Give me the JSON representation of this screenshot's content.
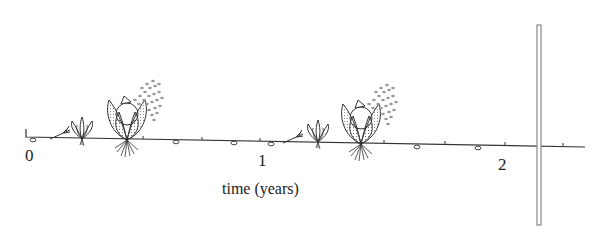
{
  "diagram": {
    "axis": {
      "title": "time (years)",
      "ticks": [
        {
          "label": "0",
          "value": 0
        },
        {
          "label": "1",
          "value": 1
        },
        {
          "label": "2",
          "value": 2
        }
      ]
    },
    "stages_per_cycle": [
      "seed",
      "seedling",
      "young-plant",
      "flowering-plant-releasing-seeds"
    ],
    "cycles": 2,
    "marker": "vertical-bar-after-year-2",
    "colors": {
      "line": "#333333",
      "bar": "#9a9a9a",
      "background": "#ffffff"
    }
  }
}
